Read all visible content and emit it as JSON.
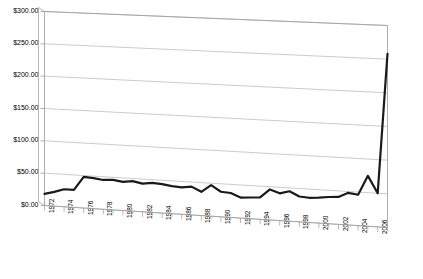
{
  "chart_data": {
    "type": "line",
    "title": "",
    "subtitle": "",
    "xlabel": "",
    "ylabel": "",
    "ylim": [
      0,
      300
    ],
    "ytick_step": 50,
    "ytick_labels": [
      "$0.00",
      "$50.00",
      "$100.00",
      "$150.00",
      "$200.00",
      "$250.00",
      "$300.00"
    ],
    "ytick_values": [
      0,
      50,
      100,
      150,
      200,
      250,
      300
    ],
    "xlim": [
      1972,
      2007
    ],
    "xtick_labels": [
      "1972",
      "1974",
      "1976",
      "1978",
      "1980",
      "1982",
      "1984",
      "1986",
      "1988",
      "1990",
      "1992",
      "1994",
      "1996",
      "1998",
      "2000",
      "2002",
      "2004",
      "2006"
    ],
    "xtick_values": [
      1972,
      1974,
      1976,
      1978,
      1980,
      1982,
      1984,
      1986,
      1988,
      1990,
      1992,
      1994,
      1996,
      1998,
      2000,
      2002,
      2004,
      2006
    ],
    "minor_ticks_every": 1,
    "grid": "horizontal",
    "legend": "none",
    "series": [
      {
        "name": "Series 1",
        "color": "#1a1a1a",
        "line_width": 2.2,
        "x": [
          1972,
          1973,
          1974,
          1975,
          1976,
          1977,
          1978,
          1979,
          1980,
          1981,
          1982,
          1983,
          1984,
          1985,
          1986,
          1987,
          1988,
          1989,
          1990,
          1991,
          1992,
          1993,
          1994,
          1995,
          1996,
          1997,
          1998,
          1999,
          2000,
          2001,
          2002,
          2003,
          2004,
          2005,
          2006,
          2007
        ],
        "values": [
          18,
          22,
          27,
          27,
          48,
          47,
          45,
          46,
          44,
          46,
          43,
          45,
          44,
          42,
          41,
          43,
          36,
          47,
          38,
          37,
          31,
          32,
          33,
          46,
          41,
          45,
          38,
          37,
          38,
          40,
          41,
          48,
          46,
          75,
          50,
          258
        ]
      }
    ],
    "axis_color": "#9a9a9a",
    "grid_color": "#b5b5b5",
    "background": "#ffffff",
    "perspective_3d": true
  }
}
